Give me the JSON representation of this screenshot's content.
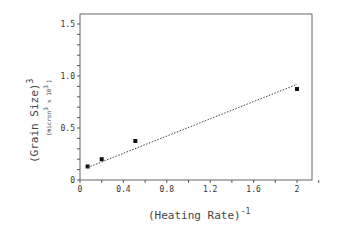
{
  "chart_data": {
    "type": "scatter",
    "title": "",
    "xlabel": "(Heating Rate)",
    "xlabel_superscript": "-1",
    "ylabel": "(Grain Size)",
    "ylabel_superscript": "3",
    "ylabel_units": "(micron",
    "ylabel_units_sup": "3",
    "ylabel_units_scale": "x 10",
    "ylabel_units_scale_sup": "3",
    "ylabel_units_close": ")",
    "xlim": [
      0,
      2.2
    ],
    "ylim": [
      0,
      1.6
    ],
    "x_ticks": [
      0,
      0.4,
      0.8,
      1.2,
      1.6,
      2
    ],
    "x_tick_labels": [
      "0",
      "0.4",
      "0.8",
      "1.2",
      "1.6",
      "2"
    ],
    "y_ticks": [
      0,
      0.5,
      1.0,
      1.5
    ],
    "y_tick_labels": [
      "0",
      "0.5",
      "1.0",
      "1.5"
    ],
    "grid": false,
    "series": [
      {
        "name": "measured",
        "marker": "square",
        "x": [
          0.07,
          0.2,
          0.51,
          2.0
        ],
        "y": [
          0.13,
          0.2,
          0.375,
          0.875
        ]
      },
      {
        "name": "linear fit",
        "style": "dotted",
        "x": [
          0.07,
          2.0
        ],
        "y": [
          0.12,
          0.92
        ]
      }
    ]
  }
}
